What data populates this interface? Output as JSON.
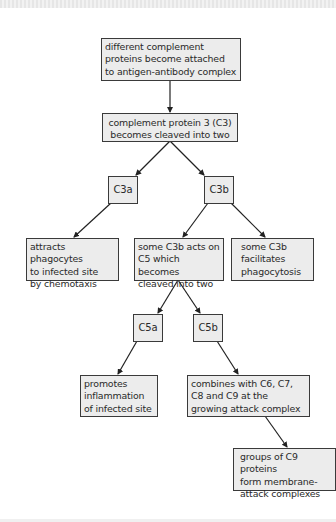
{
  "diagram": {
    "title": "",
    "colors": {
      "box_fill": "#ececec",
      "box_border": "#3a3a3a",
      "text": "#2a2a2a",
      "arrow": "#222222"
    },
    "nodes": {
      "attach": {
        "label": "different complement\nproteins become attached\nto antigen-antibody complex"
      },
      "c3_cleave": {
        "label": "complement protein 3 (C3)\nbecomes cleaved into two"
      },
      "c3a": {
        "label": "C3a"
      },
      "c3b": {
        "label": "C3b"
      },
      "chemotaxis": {
        "label": "attracts phagocytes\nto infected site\nby chemotaxis"
      },
      "c5_cleave": {
        "label": "some C3b acts on\nC5 which becomes\ncleaved into two"
      },
      "phagocytosis": {
        "label": "some C3b\nfacilitates\nphagocytosis"
      },
      "c5a": {
        "label": "C5a"
      },
      "c5b": {
        "label": "C5b"
      },
      "inflammation": {
        "label": "promotes\ninflammation\nof infected site"
      },
      "combines": {
        "label": "combines with C6, C7,\nC8 and C9 at the\ngrowing attack complex"
      },
      "mac": {
        "label": "groups of C9 proteins\nform membrane-\nattack complexes"
      }
    },
    "edges": [
      {
        "from": "attach",
        "to": "c3_cleave"
      },
      {
        "from": "c3_cleave",
        "to": "c3a"
      },
      {
        "from": "c3_cleave",
        "to": "c3b"
      },
      {
        "from": "c3a",
        "to": "chemotaxis"
      },
      {
        "from": "c3b",
        "to": "c5_cleave"
      },
      {
        "from": "c3b",
        "to": "phagocytosis"
      },
      {
        "from": "c5_cleave",
        "to": "c5a"
      },
      {
        "from": "c5_cleave",
        "to": "c5b"
      },
      {
        "from": "c5a",
        "to": "inflammation"
      },
      {
        "from": "c5b",
        "to": "combines"
      },
      {
        "from": "combines",
        "to": "mac"
      }
    ]
  }
}
